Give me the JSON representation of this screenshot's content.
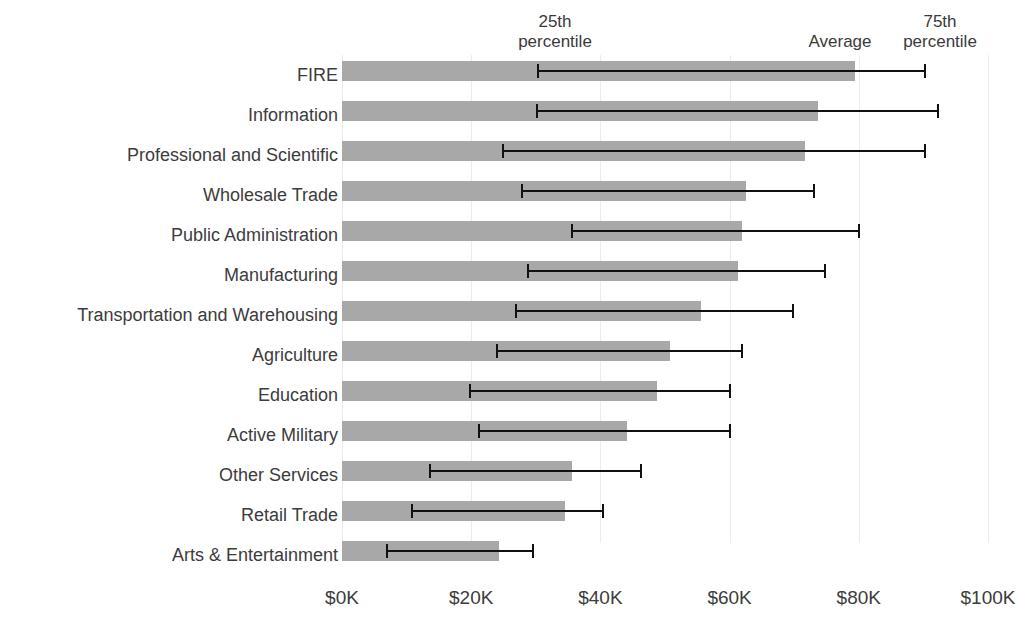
{
  "annotations": {
    "p25": "25th\npercentile",
    "average": "Average",
    "p75": "75th\npercentile"
  },
  "axis": {
    "ticks": [
      "$0K",
      "$20K",
      "$40K",
      "$60K",
      "$80K",
      "$100K"
    ],
    "tick_values": [
      0,
      20000,
      40000,
      60000,
      80000,
      100000
    ],
    "min": 0,
    "max": 100000
  },
  "colors": {
    "bar": "#a8a8a8",
    "whisker": "#111111",
    "gridline": "#ececec",
    "text": "#3c3c3c",
    "background": "#ffffff"
  },
  "chart_data": {
    "type": "bar",
    "title": "",
    "subtitle": "",
    "xlabel": "",
    "ylabel": "",
    "orientation": "horizontal",
    "grid": true,
    "legend_position": "top",
    "xlim": [
      0,
      100000
    ],
    "xtick_labels": [
      "$0K",
      "$20K",
      "$40K",
      "$60K",
      "$80K",
      "$100K"
    ],
    "xtick_values": [
      0,
      20000,
      40000,
      60000,
      80000,
      100000
    ],
    "categories": [
      "FIRE",
      "Information",
      "Professional and Scientific",
      "Wholesale Trade",
      "Public Administration",
      "Manufacturing",
      "Transportation and Warehousing",
      "Agriculture",
      "Education",
      "Active Military",
      "Other Services",
      "Retail Trade",
      "Arts & Entertainment"
    ],
    "series": [
      {
        "name": "Average",
        "role": "bar",
        "values": [
          79400,
          73700,
          71700,
          62500,
          61900,
          61300,
          55600,
          50800,
          48800,
          44100,
          35600,
          34500,
          24300
        ]
      },
      {
        "name": "25th percentile",
        "role": "error-low",
        "values": [
          30300,
          30200,
          24900,
          27900,
          35600,
          28800,
          26900,
          24000,
          19800,
          21200,
          13600,
          10800,
          7000
        ]
      },
      {
        "name": "75th percentile",
        "role": "error-high",
        "values": [
          90200,
          92300,
          90200,
          73100,
          80000,
          74800,
          69800,
          61900,
          60100,
          60100,
          46300,
          40400,
          29600
        ]
      }
    ],
    "rows": [
      {
        "category": "FIRE",
        "average": 79400,
        "p25": 30300,
        "p75": 90200
      },
      {
        "category": "Information",
        "average": 73700,
        "p25": 30200,
        "p75": 92300
      },
      {
        "category": "Professional and Scientific",
        "average": 71700,
        "p25": 24900,
        "p75": 90200
      },
      {
        "category": "Wholesale Trade",
        "average": 62500,
        "p25": 27900,
        "p75": 73100
      },
      {
        "category": "Public Administration",
        "average": 61900,
        "p25": 35600,
        "p75": 80000
      },
      {
        "category": "Manufacturing",
        "average": 61300,
        "p25": 28800,
        "p75": 74800
      },
      {
        "category": "Transportation and Warehousing",
        "average": 55600,
        "p25": 26900,
        "p75": 69800
      },
      {
        "category": "Agriculture",
        "average": 50800,
        "p25": 24000,
        "p75": 61900
      },
      {
        "category": "Education",
        "average": 48800,
        "p25": 19800,
        "p75": 60100
      },
      {
        "category": "Active Military",
        "average": 44100,
        "p25": 21200,
        "p75": 60100
      },
      {
        "category": "Other Services",
        "average": 35600,
        "p25": 13600,
        "p75": 46300
      },
      {
        "category": "Retail Trade",
        "average": 34500,
        "p25": 10800,
        "p75": 40400
      },
      {
        "category": "Arts & Entertainment",
        "average": 24300,
        "p25": 7000,
        "p75": 29600
      }
    ]
  }
}
